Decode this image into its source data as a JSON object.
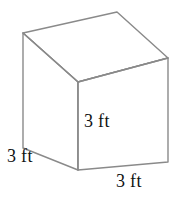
{
  "figure": {
    "kind": "cube-net-diagram",
    "shape_name": "cube",
    "background_color": "#ffffff",
    "line_color": "#8a8a8a",
    "face_fill": "#ffffff",
    "text_color": "#111111",
    "labels": {
      "front_face": "3 ft",
      "left_depth": "3 ft",
      "bottom_width": "3 ft"
    },
    "dimensions": {
      "length": "3 ft",
      "width": "3 ft",
      "height": "3 ft"
    },
    "geometry": {
      "top_back": [
        117,
        12
      ],
      "top_left": [
        23,
        33
      ],
      "top_right": [
        168,
        58
      ],
      "center_front_top": [
        78,
        82
      ],
      "bottom_left": [
        23,
        148
      ],
      "bottom_front": [
        78,
        170
      ],
      "bottom_right": [
        168,
        162
      ]
    }
  }
}
